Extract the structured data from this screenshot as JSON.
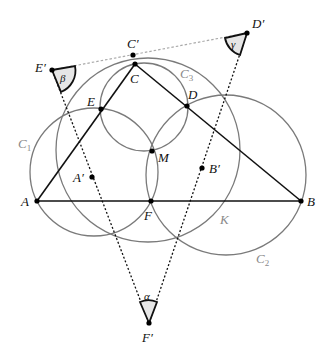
{
  "figure": {
    "colors": {
      "triangle": "#111111",
      "circle": "#7a7a7a",
      "dotted": "#111111",
      "top_dotted": "#aaaaaa",
      "angle_fill": "#e6e6e6",
      "point": "#000000"
    },
    "points": {
      "A": {
        "label": "A",
        "x": 37,
        "y": 201
      },
      "B": {
        "label": "B",
        "x": 301,
        "y": 201
      },
      "C": {
        "label": "C",
        "x": 135,
        "y": 64
      },
      "D": {
        "label": "D",
        "x": 187,
        "y": 106
      },
      "E": {
        "label": "E",
        "x": 101,
        "y": 109
      },
      "F": {
        "label": "F",
        "x": 151,
        "y": 201
      },
      "M": {
        "label": "M",
        "x": 152,
        "y": 151
      },
      "A_prime": {
        "label": "A′",
        "x": 92,
        "y": 177
      },
      "B_prime": {
        "label": "B′",
        "x": 202,
        "y": 168
      },
      "C_prime": {
        "label": "C′",
        "x": 133,
        "y": 55
      },
      "D_prime": {
        "label": "D′",
        "x": 247,
        "y": 33
      },
      "E_prime": {
        "label": "E′",
        "x": 52,
        "y": 70
      },
      "F_prime": {
        "label": "F′",
        "x": 149,
        "y": 323
      }
    },
    "circles": {
      "C1": {
        "label": "C",
        "sub": "1",
        "cx": 94,
        "cy": 172,
        "r": 64
      },
      "C2": {
        "label": "C",
        "sub": "2",
        "cx": 226,
        "cy": 175,
        "r": 80
      },
      "C3": {
        "label": "C",
        "sub": "3",
        "cx": 144,
        "cy": 107,
        "r": 44
      },
      "K": {
        "label": "K",
        "cx": 148,
        "cy": 150,
        "r": 92
      }
    },
    "angles": {
      "alpha": {
        "label": "α",
        "vertex": "F′"
      },
      "beta": {
        "label": "β",
        "vertex": "E′"
      },
      "gamma": {
        "label": "γ",
        "vertex": "D′"
      }
    }
  }
}
